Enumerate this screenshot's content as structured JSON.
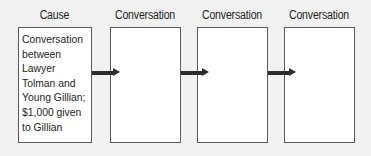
{
  "diagram": {
    "type": "flow-chain",
    "columns": [
      {
        "heading": "Cause",
        "text": "Conversation\nbetween\nLawyer\nTolman and\nYoung Gillian;\n$1,000 given\nto Gillian"
      },
      {
        "heading": "Conversation",
        "text": ""
      },
      {
        "heading": "Conversation",
        "text": ""
      },
      {
        "heading": "Conversation",
        "text": ""
      }
    ],
    "connectors": [
      {
        "from": 0,
        "to": 1,
        "icon": "arrow-right-icon"
      },
      {
        "from": 1,
        "to": 2,
        "icon": "arrow-right-icon"
      },
      {
        "from": 2,
        "to": 3,
        "icon": "arrow-right-icon"
      }
    ]
  },
  "colors": {
    "background": "#f1f1f1",
    "box_fill": "#ffffff",
    "box_border": "#5a5a5a",
    "arrow": "#2b2b2b",
    "text": "#231f20"
  }
}
